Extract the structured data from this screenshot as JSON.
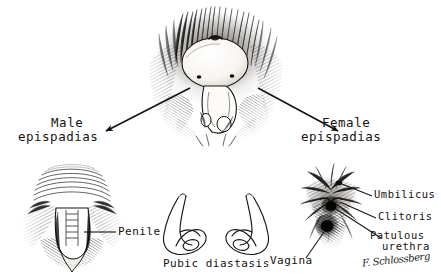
{
  "figure": {
    "background_color": "#ffffff",
    "ink_color": "#15130f",
    "medium": "pen-and-ink crosshatch drawing"
  },
  "labels": {
    "male_epispadias_line1": "Male",
    "male_epispadias_line2": "epispadias",
    "female_epispadias_line1": "Female",
    "female_epispadias_line2": "epispadias",
    "penile": "Penile",
    "pubic_diastasis": "Pubic diastasis",
    "umbilicus": "Umbilicus",
    "clitoris": "Clitoris",
    "patulous_urethra_line1": "Patulous",
    "patulous_urethra_line2": "urethra",
    "vagina": "Vagina",
    "signature": "F. Schlossberg"
  },
  "panels": [
    {
      "id": "central",
      "name": "central-exstrophy-figure",
      "label": ""
    },
    {
      "id": "male",
      "name": "male-epispadias-figure",
      "label": "Male epispadias"
    },
    {
      "id": "pubic",
      "name": "pubic-diastasis-figure",
      "label": "Pubic diastasis"
    },
    {
      "id": "female",
      "name": "female-epispadias-figure",
      "label": "Female epispadias"
    }
  ],
  "arrows": [
    {
      "name": "arrow-to-male",
      "from": [
        190,
        88
      ],
      "to": [
        104,
        132
      ],
      "direction": "down-left"
    },
    {
      "name": "arrow-to-female",
      "from": [
        258,
        88
      ],
      "to": [
        340,
        132
      ],
      "direction": "down-right"
    }
  ],
  "leaders": [
    {
      "name": "leader-penile",
      "from": [
        86,
        233
      ],
      "to": [
        116,
        233
      ]
    },
    {
      "name": "leader-umbilicus",
      "from": [
        345,
        184
      ],
      "to": [
        372,
        196
      ]
    },
    {
      "name": "leader-clitoris",
      "from": [
        347,
        203
      ],
      "to": [
        375,
        219
      ]
    },
    {
      "name": "leader-patulous-urethra",
      "from": [
        349,
        206
      ],
      "to": [
        380,
        238
      ]
    },
    {
      "name": "leader-vagina",
      "from": [
        337,
        224
      ],
      "to": [
        307,
        258
      ]
    }
  ]
}
